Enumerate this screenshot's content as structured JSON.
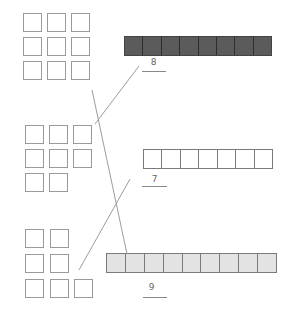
{
  "worksheet": {
    "square_groups": [
      {
        "id": "group-1",
        "count": 9,
        "rows": [
          3,
          3,
          3
        ]
      },
      {
        "id": "group-2",
        "count": 8,
        "rows": [
          3,
          3,
          2
        ]
      },
      {
        "id": "group-3",
        "count": 7,
        "rows": [
          2,
          2,
          3
        ]
      }
    ],
    "bars": [
      {
        "id": "bar-1",
        "cells": 8,
        "fill": "dark",
        "fill_color": "#5b5b5b",
        "answer": "8"
      },
      {
        "id": "bar-2",
        "cells": 7,
        "fill": "white",
        "fill_color": "#ffffff",
        "answer": "7"
      },
      {
        "id": "bar-3",
        "cells": 9,
        "fill": "light",
        "fill_color": "#e3e3e3",
        "answer": "9"
      }
    ],
    "matches": [
      {
        "from": "group-1",
        "to": "bar-3"
      },
      {
        "from": "group-2",
        "to": "bar-1"
      },
      {
        "from": "group-3",
        "to": "bar-2"
      }
    ]
  }
}
